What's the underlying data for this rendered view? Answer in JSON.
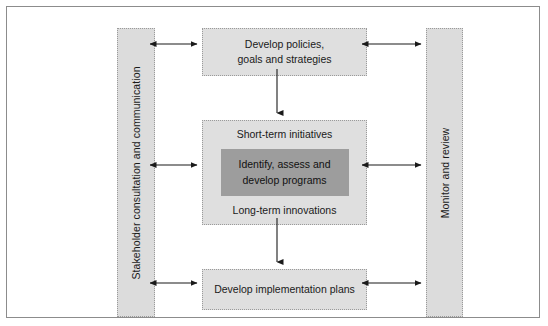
{
  "diagram": {
    "colors": {
      "frame_border": "#8c8c8c",
      "box_fill": "#dfdfdf",
      "column_fill": "#dcdcdc",
      "box_border": "#9a9a9a",
      "inner_box_fill": "#9d9d9d",
      "arrow": "#1a1a1a",
      "text": "#1a1a1a",
      "background": "#ffffff"
    },
    "columns": {
      "left": {
        "label": "Stakeholder consultation and communication",
        "orientation": "vertical"
      },
      "right": {
        "label": "Monitor and review",
        "orientation": "vertical"
      }
    },
    "boxes": {
      "top": {
        "line1": "Develop policies,",
        "line2": "goals and strategies"
      },
      "middle": {
        "top_label": "Short-term initiatives",
        "inner": {
          "line1": "Identify, assess and",
          "line2": "develop programs"
        },
        "bottom_label": "Long-term innovations"
      },
      "bottom": {
        "label": "Develop implementation plans"
      }
    },
    "connectors": [
      {
        "name": "left-to-top",
        "type": "double-headed-horizontal"
      },
      {
        "name": "top-to-right",
        "type": "double-headed-horizontal"
      },
      {
        "name": "left-to-middle",
        "type": "double-headed-horizontal"
      },
      {
        "name": "middle-to-right",
        "type": "double-headed-horizontal"
      },
      {
        "name": "left-to-bottom",
        "type": "double-headed-horizontal"
      },
      {
        "name": "bottom-to-right",
        "type": "double-headed-horizontal"
      },
      {
        "name": "top-to-middle",
        "type": "single-headed-vertical-down"
      },
      {
        "name": "middle-to-bottom",
        "type": "single-headed-vertical-down"
      }
    ]
  }
}
